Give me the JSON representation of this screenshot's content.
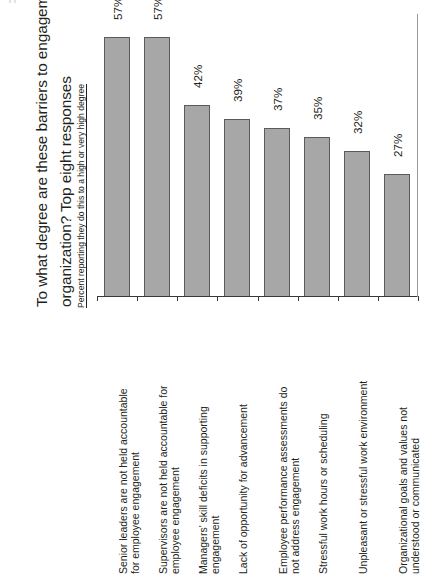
{
  "chart_data": {
    "type": "bar",
    "title": "To what degree are these barriers to engagement in your organization? Top eight responses",
    "title_line1": "To what degree are these barriers to engagement in your",
    "title_line2": "organization? Top eight responses",
    "subtitle": "Percent reporting they do this to a high or very high degree",
    "xlabel": "",
    "ylabel": "",
    "ylim": [
      0,
      62
    ],
    "grid": false,
    "legend": "none",
    "orientation": "vertical",
    "bar_color": "#a7a7a7",
    "bar_border_color": "#5b5b5b",
    "axis_color": "#3a3a3a",
    "categories": [
      "Senior leaders are not held accountable for employee engagement",
      "Supervisors are not held accountable for employee engagement",
      "Managers' skill deficits in supporting engagement",
      "Lack of opportunity for advancement",
      "Employee performance assessments do not address engagement",
      "Stressful work hours or scheduling",
      "Unpleasant or stressful work environment",
      "Organizational goals and values not understood or communicated"
    ],
    "category_lines": [
      [
        "Senior leaders are not held accountable",
        "for employee engagement"
      ],
      [
        "Supervisors are not held accountable for",
        "employee engagement"
      ],
      [
        "Managers' skill deficits in supporting",
        "engagement"
      ],
      [
        "Lack of opportunity for advancement",
        ""
      ],
      [
        "Employee performance assessments do",
        "not address engagement"
      ],
      [
        "Stressful work hours or scheduling",
        ""
      ],
      [
        "Unpleasant or stressful work environment",
        ""
      ],
      [
        "Organizational goals and values not",
        "understood or communicated"
      ]
    ],
    "values": [
      57,
      57,
      42,
      39,
      37,
      35,
      32,
      27
    ],
    "value_labels": [
      "57%",
      "57%",
      "42%",
      "39%",
      "37%",
      "35%",
      "32%",
      "27%"
    ]
  }
}
